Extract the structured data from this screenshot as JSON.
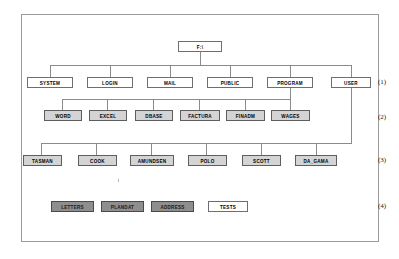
{
  "diagram": {
    "root": {
      "label": "F:\\",
      "style": "white"
    },
    "level_labels": [
      {
        "text": "(1)"
      },
      {
        "text": "(2)"
      },
      {
        "text": "(3)"
      },
      {
        "text": "(4)"
      }
    ],
    "levels": [
      {
        "index": 1,
        "label": "(1)",
        "nodes": [
          {
            "label": "SYSTEM",
            "style": "white"
          },
          {
            "label": "LOGIN",
            "style": "white"
          },
          {
            "label": "MAIL",
            "style": "white"
          },
          {
            "label": "PUBLIC",
            "style": "white"
          },
          {
            "label": "PROGRAM",
            "style": "white"
          },
          {
            "label": "USER",
            "style": "white"
          }
        ]
      },
      {
        "index": 2,
        "label": "(2)",
        "nodes": [
          {
            "label": "WORD",
            "style": "shaded"
          },
          {
            "label": "EXCEL",
            "style": "shaded"
          },
          {
            "label": "DBASE",
            "style": "shaded"
          },
          {
            "label": "FACTURA",
            "style": "shaded"
          },
          {
            "label": "FINADM",
            "style": "shaded"
          },
          {
            "label": "WAGES",
            "style": "shaded"
          }
        ]
      },
      {
        "index": 3,
        "label": "(3)",
        "nodes": [
          {
            "label": "TASMAN",
            "style": "shaded"
          },
          {
            "label": "COOK",
            "style": "shaded"
          },
          {
            "label": "AMUNDSEN",
            "style": "shaded"
          },
          {
            "label": "POLO",
            "style": "shaded"
          },
          {
            "label": "SCOTT",
            "style": "shaded"
          },
          {
            "label": "DA_GAMA",
            "style": "shaded"
          }
        ]
      },
      {
        "index": 4,
        "label": "(4)",
        "nodes": [
          {
            "label": "LETTERS",
            "style": "dark"
          },
          {
            "label": "PLANDAT",
            "style": "dark"
          },
          {
            "label": "ADDRESS",
            "style": "dark"
          },
          {
            "label": "TESTS",
            "style": "white"
          }
        ]
      }
    ],
    "colors": {
      "frame_border": "#9a9a9a",
      "line": "#8b8b8b",
      "node_border": "#6e6e6e",
      "node_white_fill": "#ffffff",
      "node_shaded_fill": "#d4d4d4",
      "node_dark_fill": "#8e8e8e",
      "background": "#ffffff"
    }
  }
}
